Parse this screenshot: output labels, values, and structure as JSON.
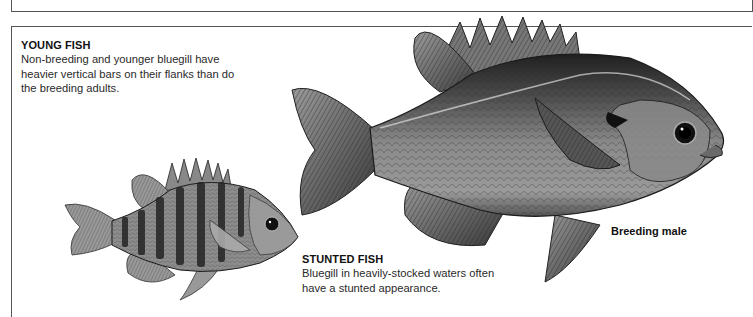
{
  "captions": {
    "young_fish": {
      "heading": "YOUNG FISH",
      "body": "Non-breeding and younger bluegill have heavier vertical bars on their flanks than do the breeding adults."
    },
    "stunted_fish": {
      "heading": "STUNTED FISH",
      "body": "Bluegill in heavily-stocked waters often have a stunted appearance."
    },
    "breeding_male": {
      "label": "Breeding male"
    }
  },
  "illustrations": [
    {
      "name": "breeding-male-bluegill",
      "icon": "fish-illustration"
    },
    {
      "name": "stunted-bluegill",
      "icon": "fish-illustration"
    }
  ],
  "colors": {
    "border": "#555555",
    "fish_dark": "#1e1e1e",
    "fish_mid": "#6e6e6e",
    "fish_light": "#bdbdbd",
    "text": "#2a2a2a"
  }
}
